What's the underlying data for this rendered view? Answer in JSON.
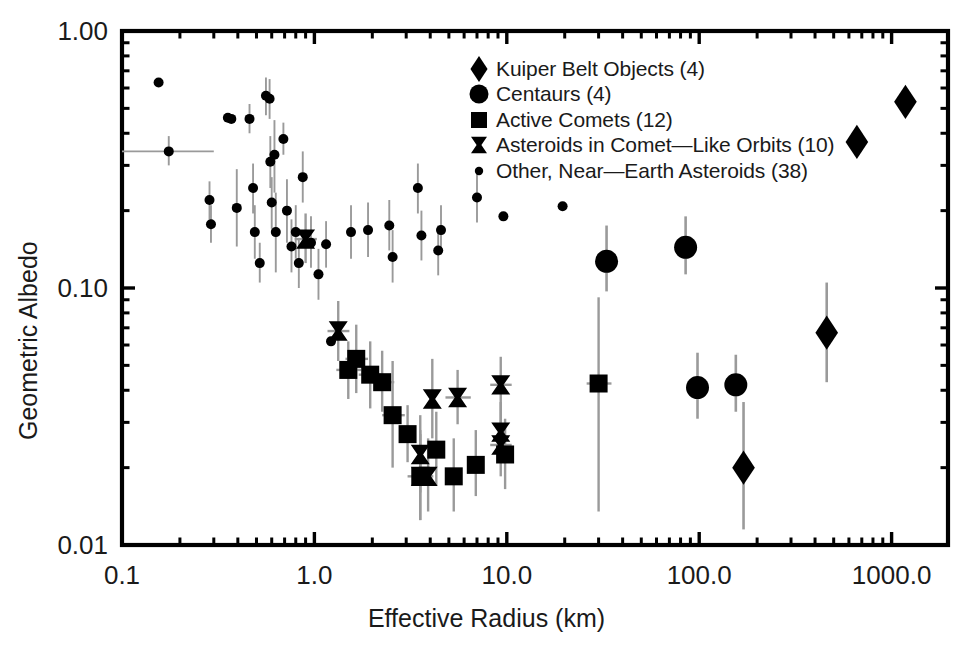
{
  "chart_data": {
    "type": "scatter",
    "title": "",
    "xlabel": "Effective Radius (km)",
    "ylabel": "Geometric Albedo",
    "xscale": "log",
    "yscale": "log",
    "xlim": [
      0.1,
      1300.0
    ],
    "ylim": [
      0.01,
      1.0
    ],
    "xticks": [
      "0.1",
      "1.0",
      "10.0",
      "100.0",
      "1000.0"
    ],
    "xtick_values": [
      0.1,
      1.0,
      10.0,
      100.0,
      1000.0
    ],
    "yticks": [
      "1.00",
      "0.10",
      "0.01"
    ],
    "ytick_values": [
      1.0,
      0.1,
      0.01
    ],
    "grid": false,
    "legend_position": "top-center-right",
    "marker_color": "#000000",
    "errorbar_color": "#9a9a9a",
    "axis_color": "#000000",
    "series": [
      {
        "name": "Kuiper Belt Objects (4)",
        "marker": "diamond",
        "count": 4,
        "points": [
          {
            "x": 1180,
            "y": 0.53,
            "yerr_lo": 0.47,
            "yerr_hi": 0.6
          },
          {
            "x": 660,
            "y": 0.37,
            "yerr_lo": 0.37,
            "yerr_hi": 0.37
          },
          {
            "x": 460,
            "y": 0.067,
            "yerr_lo": 0.043,
            "yerr_hi": 0.105
          },
          {
            "x": 170,
            "y": 0.02,
            "yerr_lo": 0.0115,
            "yerr_hi": 0.036
          }
        ]
      },
      {
        "name": "Centaurs (4)",
        "marker": "circle",
        "count": 4,
        "points": [
          {
            "x": 33,
            "y": 0.127,
            "yerr_lo": 0.097,
            "yerr_hi": 0.175
          },
          {
            "x": 85,
            "y": 0.144,
            "yerr_lo": 0.113,
            "yerr_hi": 0.19
          },
          {
            "x": 98,
            "y": 0.041,
            "yerr_lo": 0.031,
            "yerr_hi": 0.056
          },
          {
            "x": 155,
            "y": 0.042,
            "yerr_lo": 0.033,
            "yerr_hi": 0.055
          }
        ]
      },
      {
        "name": "Active Comets (12)",
        "marker": "square",
        "count": 12,
        "points": [
          {
            "x": 1.65,
            "y": 0.053,
            "yerr_lo": 0.039,
            "yerr_hi": 0.072,
            "xerr_lo": 1.45,
            "xerr_hi": 1.9
          },
          {
            "x": 1.5,
            "y": 0.048,
            "yerr_lo": 0.037,
            "yerr_hi": 0.062,
            "xerr_lo": 1.3,
            "xerr_hi": 1.75
          },
          {
            "x": 1.95,
            "y": 0.046,
            "yerr_lo": 0.034,
            "yerr_hi": 0.062,
            "xerr_lo": 1.7,
            "xerr_hi": 2.25
          },
          {
            "x": 2.25,
            "y": 0.043,
            "yerr_lo": 0.033,
            "yerr_hi": 0.057,
            "xerr_lo": 2.0,
            "xerr_hi": 2.6
          },
          {
            "x": 2.55,
            "y": 0.032,
            "yerr_lo": 0.02,
            "yerr_hi": 0.052,
            "xerr_lo": 2.25,
            "xerr_hi": 2.95
          },
          {
            "x": 3.05,
            "y": 0.027,
            "yerr_lo": 0.021,
            "yerr_hi": 0.035
          },
          {
            "x": 3.55,
            "y": 0.0185,
            "yerr_lo": 0.0125,
            "yerr_hi": 0.027
          },
          {
            "x": 4.3,
            "y": 0.0235,
            "yerr_lo": 0.017,
            "yerr_hi": 0.033
          },
          {
            "x": 5.3,
            "y": 0.0185,
            "yerr_lo": 0.0135,
            "yerr_hi": 0.026
          },
          {
            "x": 6.9,
            "y": 0.0205,
            "yerr_lo": 0.0155,
            "yerr_hi": 0.028
          },
          {
            "x": 9.8,
            "y": 0.0225,
            "yerr_lo": 0.0165,
            "yerr_hi": 0.031
          },
          {
            "x": 30.0,
            "y": 0.0425,
            "yerr_lo": 0.0135,
            "yerr_hi": 0.092,
            "xerr_lo": 26.0,
            "xerr_hi": 35.0
          }
        ]
      },
      {
        "name": "Asteroids in Comet—Like Orbits (10)",
        "marker": "bowtie",
        "count": 10,
        "points": [
          {
            "x": 0.9,
            "y": 0.155,
            "yerr_lo": 0.125,
            "yerr_hi": 0.195,
            "xerr_lo": 0.79,
            "xerr_hi": 1.03
          },
          {
            "x": 1.33,
            "y": 0.068,
            "yerr_lo": 0.052,
            "yerr_hi": 0.089,
            "xerr_lo": 1.17,
            "xerr_hi": 1.52
          },
          {
            "x": 4.1,
            "y": 0.037,
            "yerr_lo": 0.026,
            "yerr_hi": 0.053
          },
          {
            "x": 5.55,
            "y": 0.0375,
            "yerr_lo": 0.0295,
            "yerr_hi": 0.048,
            "xerr_lo": 4.8,
            "xerr_hi": 6.5
          },
          {
            "x": 9.3,
            "y": 0.042,
            "yerr_lo": 0.033,
            "yerr_hi": 0.054,
            "xerr_lo": 8.2,
            "xerr_hi": 10.6
          },
          {
            "x": 9.3,
            "y": 0.0275,
            "yerr_lo": 0.0215,
            "yerr_hi": 0.036
          },
          {
            "x": 9.3,
            "y": 0.0245,
            "yerr_lo": 0.0185,
            "yerr_hi": 0.033,
            "xerr_lo": 8.2,
            "xerr_hi": 10.6
          },
          {
            "x": 3.55,
            "y": 0.0225,
            "yerr_lo": 0.016,
            "yerr_hi": 0.032
          },
          {
            "x": 3.55,
            "y": 0.0185,
            "yerr_lo": 0.0125,
            "yerr_hi": 0.028,
            "xerr_lo": 3.05,
            "xerr_hi": 4.15
          },
          {
            "x": 3.9,
            "y": 0.0185,
            "yerr_lo": 0.0135,
            "yerr_hi": 0.026
          }
        ]
      },
      {
        "name": "Other, Near—Earth Asteroids (38)",
        "marker": "dot",
        "count": 38,
        "points": [
          {
            "x": 0.155,
            "y": 0.63
          },
          {
            "x": 0.175,
            "y": 0.34,
            "xerr_lo": 0.1,
            "xerr_hi": 0.3,
            "yerr_lo": 0.3,
            "yerr_hi": 0.39
          },
          {
            "x": 0.285,
            "y": 0.22,
            "yerr_lo": 0.185,
            "yerr_hi": 0.26
          },
          {
            "x": 0.29,
            "y": 0.177,
            "yerr_lo": 0.15,
            "yerr_hi": 0.21
          },
          {
            "x": 0.355,
            "y": 0.46
          },
          {
            "x": 0.37,
            "y": 0.455
          },
          {
            "x": 0.395,
            "y": 0.205,
            "yerr_lo": 0.145,
            "yerr_hi": 0.29
          },
          {
            "x": 0.46,
            "y": 0.455,
            "yerr_lo": 0.4,
            "yerr_hi": 0.52
          },
          {
            "x": 0.48,
            "y": 0.245,
            "yerr_lo": 0.195,
            "yerr_hi": 0.305
          },
          {
            "x": 0.49,
            "y": 0.165,
            "yerr_lo": 0.13,
            "yerr_hi": 0.21
          },
          {
            "x": 0.52,
            "y": 0.125,
            "yerr_lo": 0.105,
            "yerr_hi": 0.15
          },
          {
            "x": 0.56,
            "y": 0.56,
            "yerr_lo": 0.47,
            "yerr_hi": 0.66
          },
          {
            "x": 0.585,
            "y": 0.545,
            "yerr_lo": 0.455,
            "yerr_hi": 0.65
          },
          {
            "x": 0.59,
            "y": 0.31,
            "yerr_lo": 0.245,
            "yerr_hi": 0.39
          },
          {
            "x": 0.6,
            "y": 0.215,
            "yerr_lo": 0.17,
            "yerr_hi": 0.27
          },
          {
            "x": 0.62,
            "y": 0.33,
            "yerr_lo": 0.235,
            "yerr_hi": 0.45
          },
          {
            "x": 0.63,
            "y": 0.165,
            "yerr_lo": 0.115,
            "yerr_hi": 0.235
          },
          {
            "x": 0.69,
            "y": 0.38,
            "yerr_lo": 0.33,
            "yerr_hi": 0.44
          },
          {
            "x": 0.72,
            "y": 0.2,
            "yerr_lo": 0.15,
            "yerr_hi": 0.265
          },
          {
            "x": 0.76,
            "y": 0.145,
            "yerr_lo": 0.115,
            "yerr_hi": 0.185
          },
          {
            "x": 0.8,
            "y": 0.165,
            "yerr_lo": 0.13,
            "yerr_hi": 0.21
          },
          {
            "x": 0.83,
            "y": 0.125,
            "yerr_lo": 0.1,
            "yerr_hi": 0.155
          },
          {
            "x": 0.87,
            "y": 0.27,
            "yerr_lo": 0.215,
            "yerr_hi": 0.34
          },
          {
            "x": 0.96,
            "y": 0.15,
            "yerr_lo": 0.12,
            "yerr_hi": 0.19
          },
          {
            "x": 1.05,
            "y": 0.113,
            "yerr_lo": 0.09,
            "yerr_hi": 0.142
          },
          {
            "x": 1.15,
            "y": 0.148,
            "yerr_lo": 0.12,
            "yerr_hi": 0.182
          },
          {
            "x": 1.22,
            "y": 0.062,
            "yerr_lo": 0.062,
            "yerr_hi": 0.062
          },
          {
            "x": 1.55,
            "y": 0.165,
            "yerr_lo": 0.13,
            "yerr_hi": 0.21
          },
          {
            "x": 1.9,
            "y": 0.168,
            "yerr_lo": 0.132,
            "yerr_hi": 0.215
          },
          {
            "x": 2.45,
            "y": 0.175,
            "yerr_lo": 0.14,
            "yerr_hi": 0.22
          },
          {
            "x": 2.55,
            "y": 0.132,
            "yerr_lo": 0.105,
            "yerr_hi": 0.168
          },
          {
            "x": 3.45,
            "y": 0.245,
            "yerr_lo": 0.195,
            "yerr_hi": 0.305
          },
          {
            "x": 3.6,
            "y": 0.16,
            "yerr_lo": 0.128,
            "yerr_hi": 0.2
          },
          {
            "x": 4.4,
            "y": 0.14,
            "yerr_lo": 0.112,
            "yerr_hi": 0.175
          },
          {
            "x": 4.55,
            "y": 0.168,
            "yerr_lo": 0.135,
            "yerr_hi": 0.21
          },
          {
            "x": 7.0,
            "y": 0.225,
            "yerr_lo": 0.18,
            "yerr_hi": 0.28
          },
          {
            "x": 9.6,
            "y": 0.19,
            "yerr_lo": 0.19,
            "yerr_hi": 0.19
          },
          {
            "x": 19.5,
            "y": 0.208,
            "yerr_lo": 0.208,
            "yerr_hi": 0.208
          }
        ]
      }
    ]
  }
}
